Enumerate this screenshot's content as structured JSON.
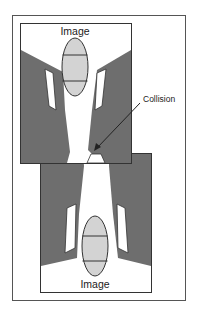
{
  "figure": {
    "top_image_label": "Image",
    "bottom_image_label": "Image",
    "collision_label": "Collision"
  },
  "colors": {
    "frame": "#555555",
    "dark_fill": "#6e6e6e",
    "ellipse_fill": "#d3d3d3",
    "white": "#ffffff",
    "stroke": "#333333"
  }
}
